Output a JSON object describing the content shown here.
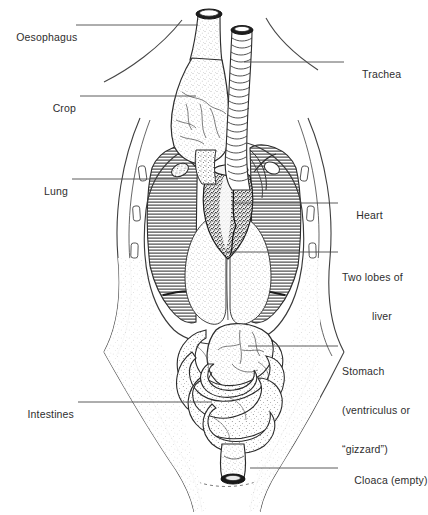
{
  "figure": {
    "background_color": "#ffffff",
    "ink_color": "#2b2b2b",
    "leader_line_color": "#4a4a4a"
  },
  "labels": {
    "oesophagus": "Oesophagus",
    "crop": "Crop",
    "lung": "Lung",
    "intestines": "Intestines",
    "trachea": "Trachea",
    "heart": "Heart",
    "liver_line1": "Two lobes of",
    "liver_line2": "liver",
    "stomach_line1": "Stomach",
    "stomach_line2": "(ventriculus or",
    "stomach_line3": "“gizzard”)",
    "cloaca": "Cloaca (empty)"
  },
  "organs": [
    {
      "name": "oesophagus",
      "label": "Oesophagus",
      "side": "left"
    },
    {
      "name": "crop",
      "label": "Crop",
      "side": "left"
    },
    {
      "name": "lung",
      "label": "Lung",
      "side": "left"
    },
    {
      "name": "intestines",
      "label": "Intestines",
      "side": "left"
    },
    {
      "name": "trachea",
      "label": "Trachea",
      "side": "right"
    },
    {
      "name": "heart",
      "label": "Heart",
      "side": "right"
    },
    {
      "name": "liver",
      "label": "Two lobes of liver",
      "side": "right"
    },
    {
      "name": "stomach",
      "label": "Stomach (ventriculus or “gizzard”)",
      "side": "right"
    },
    {
      "name": "cloaca",
      "label": "Cloaca (empty)",
      "side": "right"
    }
  ]
}
